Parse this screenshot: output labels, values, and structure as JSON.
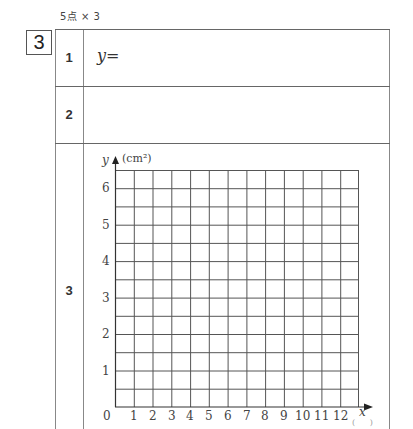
{
  "header": {
    "score": "5点 × 3",
    "question_number": "3"
  },
  "rows": [
    {
      "number": "1",
      "answer_prefix": "y="
    },
    {
      "number": "2",
      "answer_prefix": ""
    },
    {
      "number": "3",
      "answer_prefix": ""
    }
  ],
  "graph": {
    "y_axis_label": "y",
    "y_unit": "(cm²)",
    "x_axis_label": "x",
    "x_unit": "( )",
    "y_ticks": [
      "6",
      "5",
      "4",
      "3",
      "2",
      "1"
    ],
    "origin_label": "0",
    "x_ticks": [
      "1",
      "2",
      "3",
      "4",
      "5",
      "6",
      "7",
      "8",
      "9",
      "10",
      "11",
      "12"
    ],
    "grid_columns": 13,
    "grid_rows": 13,
    "line_color": "#555555"
  }
}
